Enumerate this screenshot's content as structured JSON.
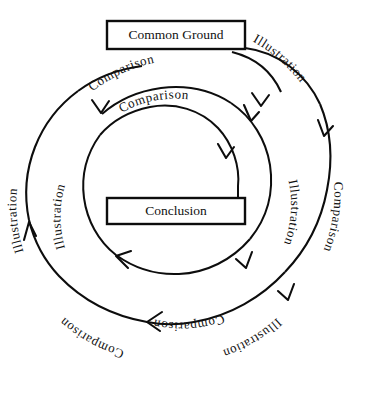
{
  "diagram": {
    "background_color": "#ffffff",
    "ink_color": "#0d0d0d",
    "boxes": [
      {
        "id": "common-ground",
        "label": "Common Ground",
        "position": "top"
      },
      {
        "id": "conclusion",
        "label": "Conclusion",
        "position": "center"
      }
    ],
    "rings": [
      {
        "id": "outer-ring",
        "name": "outer",
        "segments": [
          {
            "id": "outer-top-right",
            "label": "Illustration",
            "position": "top-right",
            "orientation": "along-arc"
          },
          {
            "id": "outer-right",
            "label": "Comparison",
            "position": "right",
            "orientation": "along-arc"
          },
          {
            "id": "outer-bottom-right",
            "label": "Illustration",
            "position": "bottom-right",
            "orientation": "along-arc"
          },
          {
            "id": "outer-bottom-left",
            "label": "Comparison",
            "position": "bottom-left",
            "orientation": "along-arc"
          },
          {
            "id": "outer-left",
            "label": "Illustration",
            "position": "left",
            "orientation": "along-arc"
          },
          {
            "id": "outer-top",
            "label": "Comparison",
            "position": "top",
            "orientation": "along-arc"
          }
        ]
      },
      {
        "id": "middle-ring",
        "name": "middle",
        "segments": [
          {
            "id": "middle-top",
            "label": "Comparison",
            "position": "top",
            "orientation": "along-arc"
          },
          {
            "id": "middle-right",
            "label": "Illustration",
            "position": "right",
            "orientation": "along-arc"
          },
          {
            "id": "middle-bottom",
            "label": "Comparison",
            "position": "bottom",
            "orientation": "along-arc"
          },
          {
            "id": "middle-left",
            "label": "Illustration",
            "position": "left",
            "orientation": "along-arc"
          }
        ]
      }
    ],
    "arrow_count": 8,
    "flow_direction": "clockwise-inward"
  }
}
